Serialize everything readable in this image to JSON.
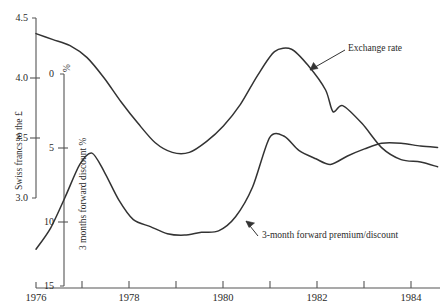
{
  "chart_data": {
    "type": "line",
    "title": "",
    "xlabel": "",
    "ylabel": "Swiss francs to the £",
    "y2label": "3 months forward discount %",
    "y2unit": "%",
    "xlim": [
      1976,
      1984.3
    ],
    "ylim": [
      3.0,
      4.5
    ],
    "y2lim": [
      0,
      15
    ],
    "y2_inverted": true,
    "grid": false,
    "legend": "none",
    "xticks": [
      1976,
      1978,
      1980,
      1982,
      1984
    ],
    "xticklabels": [
      "1976",
      "1978",
      "1980",
      "1982",
      "1984"
    ],
    "xminorticks": [
      1977,
      1979,
      1981,
      1983
    ],
    "yticks": [
      3.0,
      3.5,
      4.0,
      4.5
    ],
    "yticklabels": [
      "3.0",
      "3.5",
      "4.0",
      "4.5"
    ],
    "y2ticks": [
      0,
      5,
      10,
      15
    ],
    "y2ticklabels": [
      "0",
      "5",
      "10",
      "15"
    ],
    "annotations": [
      {
        "text": "Exchange rate",
        "x": 1982.05,
        "y": 4.22
      },
      {
        "text": "3-month forward premium/discount",
        "x": 1980.55,
        "y": 3.18
      }
    ],
    "series": [
      {
        "name": "Exchange rate",
        "axis": "left",
        "units": "Swiss francs per £",
        "x": [
          1976.0,
          1976.35,
          1976.7,
          1977.05,
          1977.4,
          1977.75,
          1978.1,
          1978.45,
          1978.8,
          1979.15,
          1979.5,
          1979.85,
          1980.2,
          1980.55,
          1980.9,
          1981.25,
          1981.6,
          1981.95,
          1982.1,
          1982.3,
          1982.7,
          1983.1,
          1983.5,
          1983.9,
          1984.25
        ],
        "y": [
          4.37,
          4.32,
          4.27,
          4.17,
          4.0,
          3.8,
          3.62,
          3.46,
          3.38,
          3.38,
          3.47,
          3.6,
          3.78,
          4.02,
          4.22,
          4.24,
          4.1,
          3.9,
          3.72,
          3.77,
          3.62,
          3.42,
          3.32,
          3.3,
          3.26
        ]
      },
      {
        "name": "3-month forward premium/discount",
        "axis": "right",
        "units": "percent per annum",
        "x": [
          1976.0,
          1976.3,
          1976.6,
          1976.9,
          1977.15,
          1977.4,
          1977.7,
          1978.0,
          1978.35,
          1978.7,
          1979.05,
          1979.4,
          1979.75,
          1980.1,
          1980.45,
          1980.8,
          1981.1,
          1981.4,
          1981.75,
          1982.05,
          1982.4,
          1982.75,
          1983.1,
          1983.5,
          1983.9,
          1984.25
        ],
        "y": [
          12.4,
          10.9,
          8.7,
          6.4,
          5.6,
          6.9,
          8.9,
          10.3,
          10.8,
          11.3,
          11.4,
          11.2,
          11.1,
          10.1,
          8.0,
          4.5,
          4.4,
          5.4,
          6.0,
          6.4,
          5.8,
          5.3,
          4.9,
          4.9,
          5.1,
          5.2
        ]
      }
    ]
  },
  "axes": {
    "left": {
      "label": "Swiss francs to the £",
      "ticks": [
        {
          "label": "4.5"
        },
        {
          "label": "4.0"
        },
        {
          "label": "3.5"
        },
        {
          "label": "3.0"
        }
      ]
    },
    "right_inner": {
      "label": "3 months forward discount %",
      "unit": "%",
      "ticks": [
        {
          "label": "0"
        },
        {
          "label": "5"
        },
        {
          "label": "10"
        },
        {
          "label": "15"
        }
      ]
    },
    "bottom": {
      "ticks": [
        {
          "label": "1976"
        },
        {
          "label": "1978"
        },
        {
          "label": "1980"
        },
        {
          "label": "1982"
        },
        {
          "label": "1984"
        }
      ]
    }
  },
  "annotations": {
    "exchange_rate": "Exchange rate",
    "forward": "3-month forward premium/discount"
  },
  "colors": {
    "line": "#333333",
    "axis": "#555555",
    "text": "#2a2a2a",
    "background": "#ffffff"
  }
}
